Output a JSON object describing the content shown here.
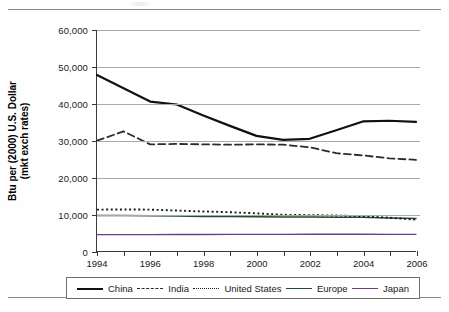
{
  "document": {
    "top_rule": true,
    "bottom_rule": true
  },
  "axes": {
    "y_title_line1": "Btu per (2000) U.S. Dollar",
    "y_title_line2": "(mkt exch rates)",
    "y_ticks": [
      "0",
      "10,000",
      "20,000",
      "30,000",
      "40,000",
      "50,000",
      "60,000"
    ],
    "x_ticks": [
      "1994",
      "1996",
      "1998",
      "2000",
      "2002",
      "2004",
      "2006"
    ]
  },
  "legend": {
    "items": [
      {
        "label": "China",
        "style": "solid-thick",
        "color": "#111111",
        "swatch": "sw-china"
      },
      {
        "label": "India",
        "style": "dashed",
        "color": "#2b2b2b",
        "swatch": "sw-india"
      },
      {
        "label": "United States",
        "style": "dotted",
        "color": "#1b1b1b",
        "swatch": "sw-us"
      },
      {
        "label": "Europe",
        "style": "solid",
        "color": "#1d4f2a",
        "swatch": "sw-europe"
      },
      {
        "label": "Japan",
        "style": "solid-thin",
        "color": "#6b3f82",
        "swatch": "sw-japan"
      }
    ]
  },
  "chart_data": {
    "type": "line",
    "title": "",
    "xlabel": "",
    "ylabel": "Btu per (2000) U.S. Dollar (mkt exch rates)",
    "x": [
      1994,
      1995,
      1996,
      1997,
      1998,
      1999,
      2000,
      2001,
      2002,
      2003,
      2004,
      2005,
      2006
    ],
    "xlim": [
      1994,
      2006
    ],
    "ylim": [
      0,
      60000
    ],
    "ytick_step": 10000,
    "grid": "horizontal",
    "legend_position": "bottom",
    "series": [
      {
        "name": "China",
        "color": "#111111",
        "dash": "none",
        "width": 2.2,
        "values": [
          47800,
          44200,
          40600,
          39800,
          36800,
          34000,
          31300,
          30200,
          30500,
          32800,
          35200,
          35400,
          35100
        ]
      },
      {
        "name": "India",
        "color": "#2b2b2b",
        "dash": "dashed",
        "width": 1.8,
        "values": [
          30000,
          32500,
          29000,
          29100,
          29000,
          28900,
          29000,
          28900,
          28200,
          26600,
          26000,
          25200,
          24800
        ]
      },
      {
        "name": "United States",
        "color": "#1b1b1b",
        "dash": "dotted",
        "width": 1.9,
        "values": [
          11300,
          11350,
          11300,
          11050,
          10800,
          10600,
          10300,
          9900,
          9800,
          9700,
          9500,
          9100,
          8600
        ]
      },
      {
        "name": "Europe",
        "color": "#1d4f2a",
        "dash": "none",
        "width": 1.5,
        "values": [
          9700,
          9700,
          9650,
          9550,
          9450,
          9400,
          9350,
          9300,
          9300,
          9250,
          9200,
          9050,
          8900
        ]
      },
      {
        "name": "Japan",
        "color": "#6b3f82",
        "dash": "none",
        "width": 1.3,
        "values": [
          4500,
          4520,
          4540,
          4550,
          4560,
          4570,
          4590,
          4600,
          4620,
          4620,
          4620,
          4610,
          4600
        ]
      }
    ]
  }
}
